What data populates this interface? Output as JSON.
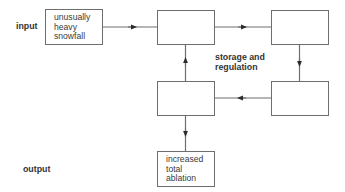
{
  "diagram": {
    "input_label": "input",
    "output_label": "output",
    "center_label": {
      "line1": "storage and",
      "line2": "regulation"
    },
    "input_box": {
      "lines": [
        "unusually",
        "heavy",
        "snowfall"
      ]
    },
    "output_box": {
      "lines": [
        "increased",
        "total",
        "ablation"
      ]
    },
    "colors": {
      "line": "#6e6e6e",
      "arrow": "#2a2a2a"
    }
  }
}
